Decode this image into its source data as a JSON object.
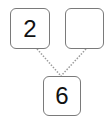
{
  "diagram": {
    "type": "number-bond",
    "parts": [
      {
        "id": "part-left",
        "value": "2"
      },
      {
        "id": "part-right",
        "value": ""
      }
    ],
    "whole": {
      "id": "whole",
      "value": "6"
    },
    "colors": {
      "border": "#7a7a7a",
      "connector": "#9a9a9a",
      "text": "#111111"
    }
  }
}
